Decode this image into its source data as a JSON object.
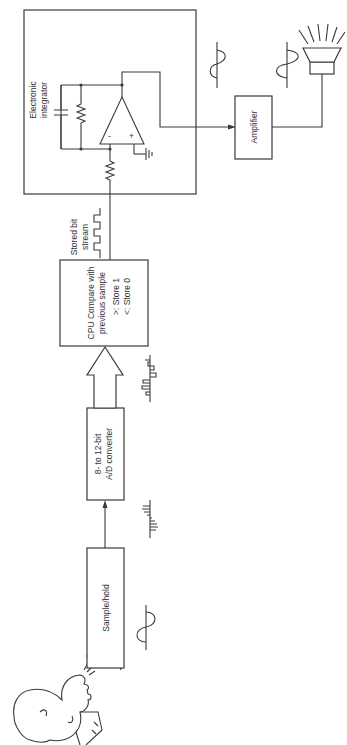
{
  "diagram": {
    "orientation": "rotated-90-ccw",
    "colors": {
      "line": "#3a3a3a",
      "text": "#333333",
      "background": "#ffffff"
    },
    "blocks": {
      "sample_hold": {
        "label": "Sample/hold"
      },
      "ad_converter": {
        "line1": "8- to 12-bit",
        "line2": "A/D converter"
      },
      "cpu": {
        "line1": "CPU Compare with",
        "line2": "previous sample",
        "line3": ">: Store 1",
        "line4": "<: Store 0"
      },
      "integrator": {
        "line1": "Electronic",
        "line2": "integrator"
      },
      "amplifier": {
        "label": "Amplifier"
      }
    },
    "annotations": {
      "bit_stream_line1": "Stored bit",
      "bit_stream_line2": "stream",
      "opamp_minus": "-",
      "opamp_plus": "+"
    },
    "icons": [
      "speaking-person-icon",
      "microphone-icon",
      "sine-wave-icon",
      "sampled-pulses-icon",
      "digital-pulses-icon",
      "square-wave-icon",
      "capacitor-icon",
      "resistor-icon",
      "op-amp-icon",
      "ground-icon",
      "speaker-icon"
    ]
  }
}
